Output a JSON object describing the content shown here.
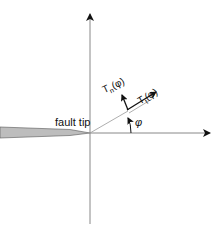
{
  "diagram": {
    "labels": {
      "fault_tip": "fault tip",
      "angle": "φ",
      "normal_traction": "T",
      "normal_sub": "n",
      "normal_arg": "(φ)",
      "tangential_traction": "T",
      "tangential_sub": "t",
      "tangential_arg": "(φ)"
    },
    "colors": {
      "axis": "#777777",
      "fault_fill": "#bdbdbd",
      "arrow": "#111111"
    }
  }
}
